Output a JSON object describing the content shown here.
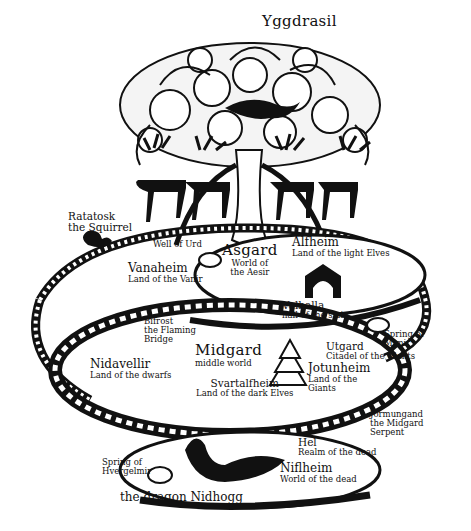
{
  "title": "Yggdrasil",
  "figure": {
    "tree": {
      "name": "Yggdrasil"
    },
    "creatures": [
      {
        "name": "Ratatosk",
        "subtitle": "the Squirrel"
      },
      {
        "name": "Jormungand",
        "subtitle_lines": [
          "the Midgard",
          "Serpent"
        ]
      },
      {
        "name": "the dragon Nidhogg"
      }
    ],
    "worlds": [
      {
        "name": "Asgard",
        "subtitle_lines": [
          "World of",
          "the Aesir"
        ]
      },
      {
        "name": "Alfheim",
        "subtitle": "Land of the light Elves"
      },
      {
        "name": "Vanaheim",
        "subtitle": "Land of the Vanir"
      },
      {
        "name": "Valhalla",
        "subtitle": "hall of the slain"
      },
      {
        "name": "Midgard",
        "subtitle": "middle world"
      },
      {
        "name": "Nidavellir",
        "subtitle": "Land of the dwarfs"
      },
      {
        "name": "Utgard",
        "subtitle": "Citadel of the Giants"
      },
      {
        "name": "Jotunheim",
        "subtitle_lines": [
          "Land of the",
          "Giants"
        ]
      },
      {
        "name": "Svartalfheim",
        "subtitle": "Land of the dark Elves"
      },
      {
        "name": "Hel",
        "subtitle": "Realm of the dead"
      },
      {
        "name": "Niflheim",
        "subtitle": "World of the dead"
      }
    ],
    "features": [
      {
        "name": "Well of Urd"
      },
      {
        "name": "Bifrost",
        "subtitle_lines": [
          "the Flaming",
          "Bridge"
        ]
      },
      {
        "name": "Spring of",
        "subtitle": "Mimir"
      },
      {
        "name": "Spring of",
        "subtitle": "Hvergelmir"
      }
    ]
  }
}
